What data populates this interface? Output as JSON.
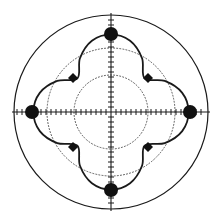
{
  "figure": {
    "title": "",
    "background_color": "#ffffff",
    "width": 221,
    "height": 224,
    "center_x": 111,
    "center_y": 112
  },
  "chart_data": {
    "type": "line",
    "subtype": "polar",
    "title": "",
    "subtitle": "",
    "xlabel": "",
    "ylabel": "",
    "grid": true,
    "legend": "none",
    "angle_unit": "degrees",
    "r_max": 1.0,
    "rlim": [
      0,
      1.0
    ],
    "theta_range": [
      0,
      360
    ],
    "grid_circles": {
      "outer_solid_radius_px": 97,
      "dotted_radii_norm": [
        0.38,
        0.66
      ],
      "dotted_radii_px": [
        37,
        64
      ],
      "style": "dotted"
    },
    "axes": {
      "crosshair": true,
      "tick_count_per_half_axis": 17,
      "tick_length_px": 3,
      "axis_angles_deg": [
        0,
        90,
        180,
        270
      ]
    },
    "series": [
      {
        "name": "pattern",
        "color": "#1a1a1a",
        "line_width_px": 1.8,
        "theta_deg": [
          0,
          15,
          30,
          45,
          60,
          75,
          90,
          105,
          120,
          135,
          150,
          165,
          180,
          195,
          210,
          225,
          240,
          255,
          270,
          285,
          300,
          315,
          330,
          345,
          360
        ],
        "r_norm": [
          0.8,
          0.76,
          0.64,
          0.49,
          0.64,
          0.76,
          0.8,
          0.76,
          0.64,
          0.49,
          0.64,
          0.76,
          0.8,
          0.76,
          0.64,
          0.49,
          0.64,
          0.76,
          0.8,
          0.76,
          0.64,
          0.49,
          0.64,
          0.76,
          0.8
        ]
      }
    ],
    "markers": {
      "major": {
        "shape": "circle",
        "count": 4,
        "radius_px": 7,
        "color": "#111111",
        "r_norm": 0.8,
        "theta_deg": [
          0,
          90,
          180,
          270
        ],
        "points_px": [
          {
            "x": 190,
            "y": 112
          },
          {
            "x": 111,
            "y": 34
          },
          {
            "x": 32,
            "y": 112
          },
          {
            "x": 111,
            "y": 190
          }
        ]
      },
      "minor": {
        "shape": "diamond",
        "count": 4,
        "radius_px": 5,
        "color": "#111111",
        "r_norm": 0.49,
        "theta_deg": [
          45,
          135,
          225,
          315
        ],
        "points_px": [
          {
            "x": 148,
            "y": 78
          },
          {
            "x": 73,
            "y": 78
          },
          {
            "x": 73,
            "y": 147
          },
          {
            "x": 148,
            "y": 147
          }
        ]
      }
    },
    "colors": {
      "curve": "#1a1a1a",
      "outer_circle": "#1a1a1a",
      "grid_dotted": "#555555",
      "axis": "#1a1a1a",
      "marker_fill": "#111111"
    }
  }
}
